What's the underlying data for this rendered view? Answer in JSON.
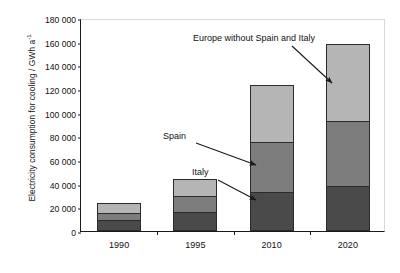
{
  "chart_data": {
    "type": "bar",
    "stacked": true,
    "title": "",
    "xlabel": "",
    "ylabel": "Electricity consumption for cooling / GWh a-1",
    "ylabel_main": "Electricity consumption for cooling / GWh a",
    "ylabel_sup": "-1",
    "categories": [
      "1990",
      "1995",
      "2010",
      "2020"
    ],
    "ylim": [
      0,
      180000
    ],
    "ytick_step": 20000,
    "ytick_labels": [
      "180 000",
      "160 000",
      "140 000",
      "120 000",
      "100 000",
      "80 000",
      "60 000",
      "40 000",
      "20 000",
      "0"
    ],
    "ytick_values": [
      180000,
      160000,
      140000,
      120000,
      100000,
      80000,
      60000,
      40000,
      20000,
      0
    ],
    "grid": false,
    "legend_position": "annotations",
    "series": [
      {
        "name": "Italy",
        "color": "#4a4a4a",
        "values": [
          9000,
          16000,
          33000,
          38000
        ]
      },
      {
        "name": "Spain",
        "color": "#7d7d7d",
        "values": [
          6000,
          14000,
          42000,
          55000
        ]
      },
      {
        "name": "Europe without Spain and Italy",
        "color": "#b5b5b5",
        "values": [
          9000,
          14000,
          48000,
          65000
        ]
      }
    ],
    "stack_totals": [
      24000,
      44000,
      123000,
      158000
    ],
    "annotations": [
      {
        "key": "europe",
        "text": "Europe without Spain and Italy"
      },
      {
        "key": "spain",
        "text": "Spain"
      },
      {
        "key": "italy",
        "text": "Italy"
      }
    ]
  }
}
